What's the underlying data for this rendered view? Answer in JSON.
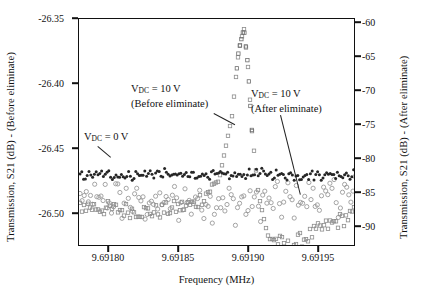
{
  "chart_data": {
    "type": "line",
    "title": "",
    "xlabel": "Frequency (MHz)",
    "ylabel_left": "Transmission, S21 (dB) - (Before eliminate)",
    "ylabel_right": "Transmission, S21 (dB) - (After eliminate)",
    "x_ticks": [
      "9.69180",
      "9.69185",
      "9.69190",
      "9.69195"
    ],
    "x_tick_values": [
      9.6918,
      9.69185,
      9.6919,
      9.69195
    ],
    "xlim": [
      9.691772,
      9.691982
    ],
    "y_ticks_left": [
      "-26.35",
      "-26.40",
      "-26.45",
      "-26.50"
    ],
    "y_tick_values_left": [
      -26.35,
      -26.4,
      -26.45,
      -26.5
    ],
    "ylim_left": [
      -26.521,
      -26.345
    ],
    "y_ticks_right": [
      "-60",
      "-65",
      "-70",
      "-75",
      "-80",
      "-85",
      "-90"
    ],
    "y_tick_values_right": [
      -60,
      -65,
      -70,
      -75,
      -80,
      -85,
      -90
    ],
    "ylim_right": [
      -91.8,
      -58.5
    ],
    "grid": false,
    "legend": "annotations-inline",
    "annotations": [
      {
        "id": "vdc0",
        "text_line1": "V",
        "sub": "DC",
        "text_line2": " = 0 V",
        "full": "V_DC = 0 V",
        "x": 86,
        "y": 135
      },
      {
        "id": "vdc10-before",
        "line1": "V_DC = 10 V",
        "line2": "(Before eliminate)",
        "x": 133,
        "y": 85
      },
      {
        "id": "vdc10-after",
        "line1": "V_DC = 10 V",
        "line2": "(After eliminate)",
        "x": 253,
        "y": 90
      }
    ],
    "series": [
      {
        "name": "V_DC = 0 V",
        "axis": "left",
        "style": "dark-noisy-flat",
        "color": "#262626",
        "description": "Flat noisy baseline near -26.465 dB across full span",
        "x": [
          9.691772,
          9.69179,
          9.69181,
          9.69183,
          9.69185,
          9.69187,
          9.69189,
          9.691905,
          9.69192,
          9.69194,
          9.69196,
          9.691982
        ],
        "y": [
          -26.466,
          -26.465,
          -26.466,
          -26.464,
          -26.466,
          -26.465,
          -26.466,
          -26.464,
          -26.465,
          -26.466,
          -26.465,
          -26.465
        ]
      },
      {
        "name": "V_DC = 10 V (Before eliminate)",
        "axis": "left",
        "style": "open-squares-resonance",
        "color": "#8c8c8c",
        "description": "Resonance peak at 9.69190 MHz rising to -26.35 dB then dipping to below -26.52 dB just after peak",
        "x": [
          9.691772,
          9.6918,
          9.69183,
          9.69186,
          9.691878,
          9.691888,
          9.691893,
          9.691897,
          9.6919,
          9.691903,
          9.691908,
          9.691915,
          9.69193,
          9.69196,
          9.691982
        ],
        "y": [
          -26.489,
          -26.492,
          -26.494,
          -26.488,
          -26.47,
          -26.42,
          -26.37,
          -26.352,
          -26.38,
          -26.43,
          -26.48,
          -26.512,
          -26.521,
          -26.505,
          -26.495
        ]
      },
      {
        "name": "V_DC = 10 V (After eliminate)",
        "axis": "right",
        "style": "gray-noisy-floor",
        "color": "#9a9a9a",
        "description": "Noisy noise floor near -85 dB rising slightly toward the right edge",
        "x": [
          9.691772,
          9.6918,
          9.69183,
          9.69186,
          9.69189,
          9.69192,
          9.69195,
          9.691982
        ],
        "y": [
          -85.2,
          -84.8,
          -85.5,
          -85.0,
          -85.6,
          -85.2,
          -84.6,
          -84.2
        ]
      }
    ]
  },
  "annotations_text": {
    "vdc0_prefix": "V",
    "vdc_sub": "DC",
    "vdc0_suffix": " = 0 V",
    "vdc10_suffix": " = 10 V",
    "before_paren": "(Before eliminate)",
    "after_paren": "(After eliminate)"
  }
}
